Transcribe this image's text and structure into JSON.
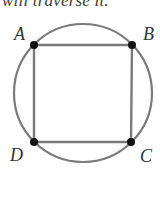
{
  "caption": {
    "text": "will traverse it."
  },
  "figure": {
    "circle": {
      "cx": 83,
      "cy": 93,
      "r": 69,
      "stroke": "#7a7a7a"
    },
    "square_stroke": "#7a7a7a",
    "vertex_color": "#111111",
    "vertices": [
      {
        "label": "A",
        "x": 34,
        "y": 45,
        "label_x": 14,
        "label_y": 40
      },
      {
        "label": "B",
        "x": 132,
        "y": 45,
        "label_x": 143,
        "label_y": 40
      },
      {
        "label": "C",
        "x": 131,
        "y": 142,
        "label_x": 140,
        "label_y": 162
      },
      {
        "label": "D",
        "x": 34,
        "y": 142,
        "label_x": 10,
        "label_y": 161
      }
    ]
  }
}
